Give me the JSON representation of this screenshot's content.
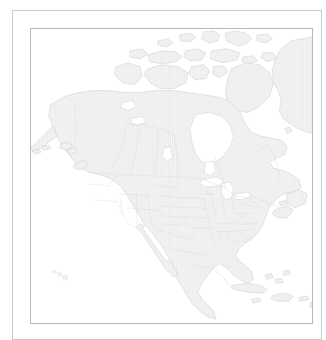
{
  "figure": {
    "kind": "map",
    "projection": "lambert-conformal-conic",
    "width": 326,
    "height": 337,
    "background_color": "#ffffff"
  },
  "frames": {
    "outer": {
      "name": "outer-frame",
      "x": 12,
      "y": 10,
      "width": 310,
      "height": 330,
      "stroke_color": "#c9c9c9",
      "stroke_width": 1
    },
    "inner": {
      "name": "inner-frame",
      "x": 30,
      "y": 28,
      "width": 283,
      "height": 296,
      "stroke_color": "#b9b9b9",
      "stroke_width": 1
    }
  },
  "style": {
    "land_fill": "#f4f4f4",
    "land_hatch_color": "#e4e4e4",
    "land_hatch_spacing": 2,
    "coastline_color": "#d2d2d2",
    "coastline_width": 0.6,
    "admin_boundary_color": "#dadada",
    "admin_boundary_width": 0.45,
    "water_fill": "#ffffff"
  },
  "regions": [
    {
      "name": "alaska",
      "label": "Alaska",
      "filled": true
    },
    {
      "name": "aleutian-islands",
      "label": "Aleutian Islands",
      "filled": true
    },
    {
      "name": "canada-mainland",
      "label": "Canada",
      "filled": true
    },
    {
      "name": "canadian-arctic-archipelago",
      "label": "Canadian Arctic Archipelago",
      "filled": true
    },
    {
      "name": "baffin-island",
      "label": "Baffin Island",
      "filled": true
    },
    {
      "name": "victoria-island",
      "label": "Victoria Island",
      "filled": true
    },
    {
      "name": "banks-island",
      "label": "Banks Island",
      "filled": true
    },
    {
      "name": "ellesmere-island",
      "label": "Ellesmere Island",
      "filled": true
    },
    {
      "name": "greenland",
      "label": "Greenland",
      "filled": true
    },
    {
      "name": "newfoundland",
      "label": "Newfoundland",
      "filled": true
    },
    {
      "name": "united-states",
      "label": "United States",
      "filled": true
    },
    {
      "name": "mexico",
      "label": "Mexico",
      "filled": true
    },
    {
      "name": "baja-california",
      "label": "Baja California",
      "filled": true
    },
    {
      "name": "central-america",
      "label": "Central America",
      "filled": true
    },
    {
      "name": "cuba",
      "label": "Cuba",
      "filled": true
    },
    {
      "name": "hispaniola",
      "label": "Hispaniola",
      "filled": true
    },
    {
      "name": "jamaica",
      "label": "Jamaica",
      "filled": true
    },
    {
      "name": "puerto-rico",
      "label": "Puerto Rico",
      "filled": true
    },
    {
      "name": "bahamas",
      "label": "Bahamas",
      "filled": true
    },
    {
      "name": "hawaii",
      "label": "Hawaiian Islands",
      "filled": true
    },
    {
      "name": "hudson-bay",
      "label": "Hudson Bay",
      "filled": false
    },
    {
      "name": "great-lakes",
      "label": "Great Lakes",
      "filled": false
    },
    {
      "name": "great-bear-lake",
      "label": "Great Bear Lake",
      "filled": false
    },
    {
      "name": "great-slave-lake",
      "label": "Great Slave Lake",
      "filled": false
    },
    {
      "name": "lake-winnipeg",
      "label": "Lake Winnipeg",
      "filled": false
    },
    {
      "name": "gulf-of-california",
      "label": "Gulf of California",
      "filled": false
    }
  ],
  "labels": {
    "visible": false,
    "items": []
  },
  "legend": {
    "visible": false,
    "items": []
  },
  "axes": {
    "visible": false,
    "graticule": false
  }
}
